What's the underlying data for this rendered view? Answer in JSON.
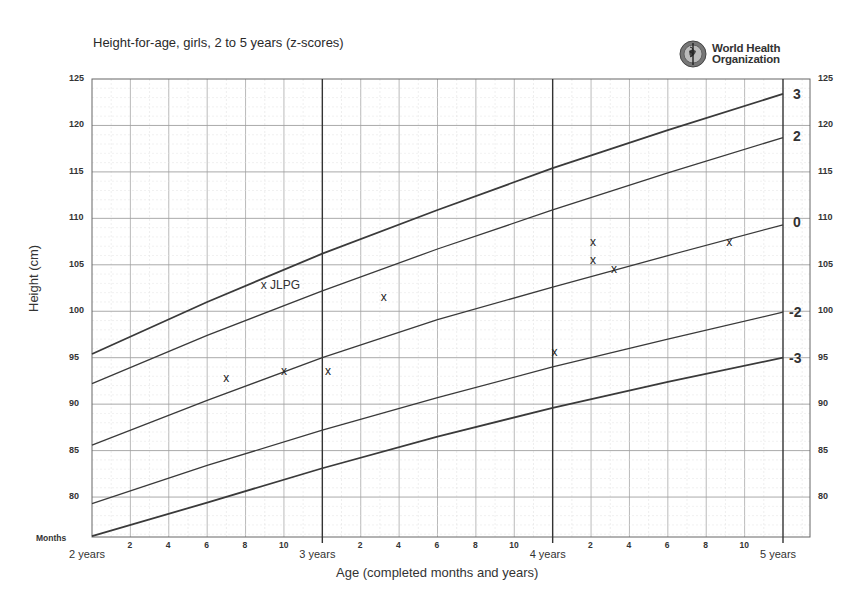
{
  "chart_data": {
    "type": "line",
    "title": "Height-for-age, girls, 2 to 5 years (z-scores)",
    "xlabel": "Age (completed months and years)",
    "ylabel": "Height (cm)",
    "x_unit": "months since 2 years",
    "xlim": [
      0,
      38
    ],
    "ylim": [
      75.7,
      125
    ],
    "grid": true,
    "x_year_ticks": [
      {
        "label": "2 years",
        "month": 0
      },
      {
        "label": "3 years",
        "month": 12
      },
      {
        "label": "4 years",
        "month": 24
      },
      {
        "label": "5 years",
        "month": 36
      }
    ],
    "x_month_ticks": [
      "2",
      "4",
      "6",
      "8",
      "10",
      "2",
      "4",
      "6",
      "8",
      "10",
      "2",
      "4",
      "6",
      "8",
      "10"
    ],
    "x_month_label": "Months",
    "y_ticks": [
      80,
      85,
      90,
      95,
      100,
      105,
      110,
      115,
      120,
      125
    ],
    "x": [
      0,
      6,
      12,
      18,
      24,
      30,
      36
    ],
    "series": [
      {
        "name": "3",
        "values": [
          95.4,
          101.0,
          106.2,
          110.9,
          115.4,
          119.5,
          123.4
        ]
      },
      {
        "name": "2",
        "values": [
          92.2,
          97.4,
          102.2,
          106.7,
          110.9,
          114.9,
          118.7
        ]
      },
      {
        "name": "0",
        "values": [
          85.6,
          90.4,
          95.0,
          99.1,
          102.6,
          106.0,
          109.3
        ]
      },
      {
        "name": "-2",
        "values": [
          79.3,
          83.4,
          87.2,
          90.7,
          94.0,
          97.0,
          99.9
        ]
      },
      {
        "name": "-3",
        "values": [
          75.8,
          79.4,
          83.1,
          86.5,
          89.6,
          92.4,
          95.0
        ]
      }
    ],
    "points": [
      {
        "month": 7,
        "height": 92.8
      },
      {
        "month": 10,
        "height": 93.6
      },
      {
        "month": 12.3,
        "height": 93.6
      },
      {
        "month": 15.2,
        "height": 101.5
      },
      {
        "month": 24.1,
        "height": 95.6
      },
      {
        "month": 26.1,
        "height": 107.5
      },
      {
        "month": 26.1,
        "height": 105.5
      },
      {
        "month": 27.2,
        "height": 104.5
      },
      {
        "month": 33.2,
        "height": 107.5
      }
    ],
    "annotations": [
      {
        "text": "x JLPG",
        "month": 9,
        "height": 102.7
      }
    ]
  },
  "header": {
    "title": "Height-for-age, girls, 2 to 5 years (z-scores)",
    "org_line1": "World Health",
    "org_line2": "Organization",
    "logo_icon": "who-emblem-icon"
  },
  "axes": {
    "ylabel": "Height (cm)",
    "xlabel": "Age (completed months and years)",
    "months_label": "Months",
    "y_ticks_left": [
      "125",
      "120",
      "115",
      "110",
      "105",
      "100",
      "95",
      "90",
      "85",
      "80"
    ],
    "y_ticks_right": [
      "125",
      "120",
      "115",
      "110",
      "105",
      "100",
      "95",
      "90",
      "85",
      "80"
    ],
    "years": [
      "2 years",
      "3 years",
      "4 years",
      "5 years"
    ],
    "month_ticks": [
      "2",
      "4",
      "6",
      "8",
      "10",
      "2",
      "4",
      "6",
      "8",
      "10",
      "2",
      "4",
      "6",
      "8",
      "10"
    ]
  },
  "zlabels": [
    "3",
    "2",
    "0",
    "-2",
    "-3"
  ],
  "annotation": "x JLPG",
  "colors": {
    "curve": "#3a3a3a",
    "grid": "#b8b8b8",
    "year_line": "#333333",
    "text": "#333333"
  }
}
